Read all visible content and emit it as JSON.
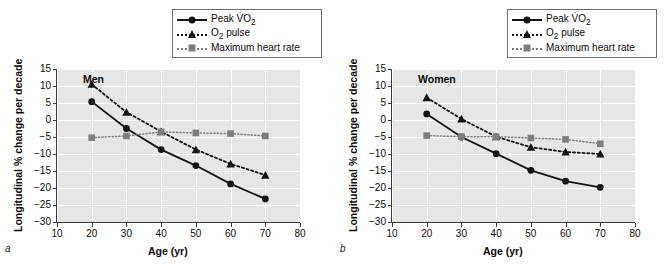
{
  "figure": {
    "panels": [
      {
        "letter": "a",
        "group_label": "Men",
        "xlabel": "Age (yr)",
        "ylabel": "Longitudinal % change per decade"
      },
      {
        "letter": "b",
        "group_label": "Women",
        "xlabel": "Age (yr)",
        "ylabel": "Longitudinal % change per decade"
      }
    ],
    "legend": {
      "items": [
        {
          "label": "Peak V̇O",
          "sub": "2",
          "marker": "circle-icon",
          "line": "solid",
          "color": "#141414"
        },
        {
          "label": "O",
          "sub": "2",
          "suffix": " pulse",
          "marker": "triangle-icon",
          "line": "dashed",
          "color": "#141414"
        },
        {
          "label": "Maximum heart rate",
          "sub": "",
          "marker": "square-icon",
          "line": "dotted",
          "color": "#7d7d7d"
        }
      ]
    }
  },
  "chart_data": [
    {
      "type": "line",
      "panel": "a",
      "title": "Men",
      "xlabel": "Age (yr)",
      "ylabel": "Longitudinal % change per decade",
      "x": [
        20,
        30,
        40,
        50,
        60,
        70
      ],
      "xlim": [
        10,
        80
      ],
      "ylim": [
        -30,
        15
      ],
      "xticks": [
        10,
        20,
        30,
        40,
        50,
        60,
        70,
        80
      ],
      "yticks": [
        15,
        10,
        5,
        0,
        -5,
        -10,
        -15,
        -20,
        -25,
        -30
      ],
      "grid": true,
      "legend_position": "above-right",
      "series": [
        {
          "name": "Peak V̇O2",
          "marker": "circle",
          "linestyle": "solid",
          "color": "#141414",
          "values": [
            5.4,
            -2.5,
            -8.7,
            -13.4,
            -18.8,
            -23.2
          ]
        },
        {
          "name": "O2 pulse",
          "marker": "triangle",
          "linestyle": "dashed",
          "color": "#141414",
          "values": [
            10.5,
            2.3,
            -3.4,
            -8.7,
            -12.9,
            -16.2
          ]
        },
        {
          "name": "Maximum heart rate",
          "marker": "square",
          "linestyle": "dotted",
          "color": "#7d7d7d",
          "values": [
            -5.2,
            -4.7,
            -3.5,
            -3.8,
            -4.0,
            -4.7
          ]
        }
      ]
    },
    {
      "type": "line",
      "panel": "b",
      "title": "Women",
      "xlabel": "Age (yr)",
      "ylabel": "Longitudinal % change per decade",
      "x": [
        20,
        30,
        40,
        50,
        60,
        70
      ],
      "xlim": [
        10,
        80
      ],
      "ylim": [
        -30,
        15
      ],
      "xticks": [
        10,
        20,
        30,
        40,
        50,
        60,
        70,
        80
      ],
      "yticks": [
        15,
        10,
        5,
        0,
        -5,
        -10,
        -15,
        -20,
        -25,
        -30
      ],
      "grid": true,
      "legend_position": "above-right",
      "series": [
        {
          "name": "Peak V̇O2",
          "marker": "circle",
          "linestyle": "solid",
          "color": "#141414",
          "values": [
            1.8,
            -5.0,
            -9.9,
            -14.8,
            -18.0,
            -19.8
          ]
        },
        {
          "name": "O2 pulse",
          "marker": "triangle",
          "linestyle": "dashed",
          "color": "#141414",
          "values": [
            6.6,
            0.3,
            -4.9,
            -8.0,
            -9.4,
            -10.0
          ]
        },
        {
          "name": "Maximum heart rate",
          "marker": "square",
          "linestyle": "dotted",
          "color": "#7d7d7d",
          "values": [
            -4.6,
            -4.9,
            -4.9,
            -5.3,
            -5.7,
            -7.0
          ]
        }
      ]
    }
  ]
}
